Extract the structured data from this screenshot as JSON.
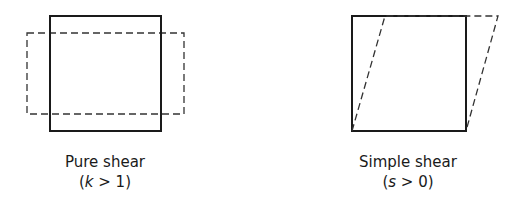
{
  "panels": [
    {
      "id": "pure-shear",
      "title": "Pure shear",
      "condition_open": "(",
      "variable": "k",
      "condition_rest": " > 1)",
      "shapes": {
        "original_square": {
          "x": 50,
          "y": 16,
          "w": 111,
          "h": 115,
          "style": "solid"
        },
        "deformed_rect": {
          "x": 27,
          "y": 33,
          "w": 157,
          "h": 81,
          "style": "dashed"
        }
      }
    },
    {
      "id": "simple-shear",
      "title": "Simple shear",
      "condition_open": "(",
      "variable": "s",
      "condition_rest": " > 0)",
      "shapes": {
        "original_square": {
          "x": 352,
          "y": 16,
          "w": 114,
          "h": 115,
          "style": "solid"
        },
        "deformed_parallelogram": {
          "points": [
            [
              352,
              131
            ],
            [
              385,
              16
            ],
            [
              498,
              16
            ],
            [
              466,
              131
            ]
          ],
          "style": "dashed"
        }
      }
    }
  ],
  "colors": {
    "stroke": "#1a1a1a",
    "dashed_stroke": "#333333",
    "background": "#ffffff"
  }
}
